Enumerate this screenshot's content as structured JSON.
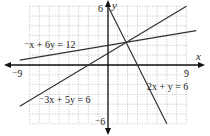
{
  "chart_data": {
    "type": "line",
    "title": "",
    "xlabel": "x",
    "ylabel": "y",
    "xlim": [
      -9,
      9
    ],
    "ylim": [
      -6,
      6
    ],
    "grid": true,
    "tick_labels": {
      "x_min": "⁻9",
      "x_max": "9",
      "y_max": "6",
      "y_min": "⁻6"
    },
    "series": [
      {
        "name": "⁻x + 6y = 12",
        "equation": "y = (x + 12) / 6",
        "points": [
          [
            -9,
            0.5
          ],
          [
            9,
            3.5
          ]
        ]
      },
      {
        "name": "2x + y = 6",
        "equation": "y = 6 - 2x",
        "points": [
          [
            0,
            6
          ],
          [
            6,
            -6
          ]
        ]
      },
      {
        "name": "⁻3x + 5y = 6",
        "equation": "y = (3x + 6) / 5",
        "points": [
          [
            -9,
            -4.2
          ],
          [
            8,
            6
          ]
        ]
      }
    ],
    "intersection": [
      1.846,
      2.308
    ],
    "colors": {
      "lines": "#333333",
      "axes": "#111111",
      "grid": "#9a9a9a"
    }
  },
  "labels": {
    "x_axis": "x",
    "y_axis": "y",
    "x_min": "⁻9",
    "x_max": "9",
    "y_max": "6",
    "y_min": "⁻6",
    "eq1": "⁻x + 6y = 12",
    "eq2": "2x + y = 6",
    "eq3": "⁻3x + 5y = 6"
  }
}
